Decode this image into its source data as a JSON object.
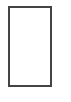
{
  "shape": {
    "type": "rectangle",
    "border_color": "#444444",
    "fill_color": "#ffffff"
  }
}
